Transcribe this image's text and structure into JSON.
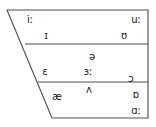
{
  "diagram": {
    "type": "vowel-chart",
    "stroke_color": "#4d4d4d",
    "text_color": "#1a1a1a",
    "background_color": "#ffffff",
    "outline": {
      "shape": "trapezoid",
      "top_left": [
        7,
        10
      ],
      "top_right": [
        148,
        10
      ],
      "bottom_right": [
        148,
        118
      ],
      "bottom_left": [
        52,
        118
      ]
    },
    "dividers": [
      {
        "name": "high-mid-divider",
        "x1": 25,
        "y1": 44,
        "x2": 148,
        "y2": 44
      },
      {
        "name": "mid-low-divider",
        "x1": 38,
        "y1": 82,
        "x2": 148,
        "y2": 82
      }
    ],
    "rows": [
      {
        "name": "close-row",
        "vowels": [
          {
            "id": "i-long",
            "symbol": "iː",
            "x": 30,
            "y": 20
          },
          {
            "id": "u-long",
            "symbol": "uː",
            "x": 136,
            "y": 20
          },
          {
            "id": "small-cap-i",
            "symbol": "ɪ",
            "x": 46,
            "y": 36
          },
          {
            "id": "upsilon",
            "symbol": "ʊ",
            "x": 124,
            "y": 36
          }
        ]
      },
      {
        "name": "mid-row",
        "vowels": [
          {
            "id": "schwa",
            "symbol": "ə",
            "x": 92,
            "y": 57
          },
          {
            "id": "epsilon",
            "symbol": "ɛ",
            "x": 45,
            "y": 72
          },
          {
            "id": "reversed-epsilon-long",
            "symbol": "ɜː",
            "x": 88,
            "y": 72
          },
          {
            "id": "open-o",
            "symbol": "ɔ",
            "x": 131,
            "y": 79
          }
        ]
      },
      {
        "name": "open-row",
        "vowels": [
          {
            "id": "caret",
            "symbol": "ʌ",
            "x": 89,
            "y": 90
          },
          {
            "id": "ash",
            "symbol": "æ",
            "x": 57,
            "y": 97
          },
          {
            "id": "turned-script-a",
            "symbol": "ɒ",
            "x": 136,
            "y": 95
          },
          {
            "id": "script-a-long",
            "symbol": "ɑː",
            "x": 136,
            "y": 111
          }
        ]
      }
    ]
  }
}
